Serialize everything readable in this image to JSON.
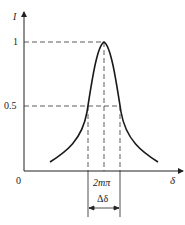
{
  "figure": {
    "y_axis_label": "I",
    "x_axis_label": "δ",
    "origin_label": "0",
    "y_ticks": [
      "1",
      "0.5"
    ],
    "center_label": "2mπ",
    "width_label": "Δδ",
    "caption": ""
  },
  "colors": {
    "line": "#222222",
    "background": "#ffffff"
  }
}
